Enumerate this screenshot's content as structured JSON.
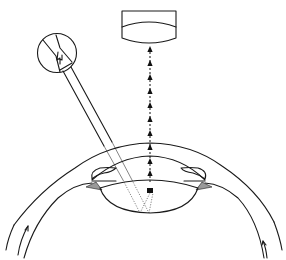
{
  "diagram": {
    "colors": {
      "stroke": "#1a1a1a",
      "background": "#ffffff"
    },
    "icons": {
      "probe_symbol": "lightning-icon",
      "beam": "dotted-arrow-up",
      "objective": "lens-housing"
    },
    "beam_arrowheads": 9
  }
}
